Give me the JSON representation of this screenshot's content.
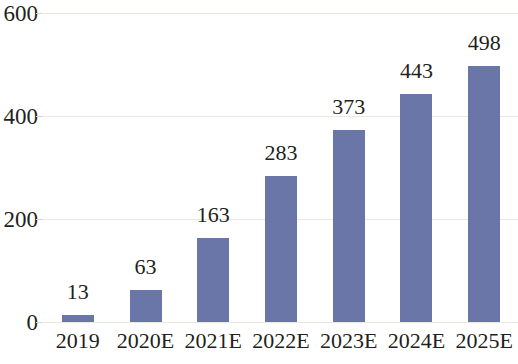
{
  "chart_data": {
    "type": "bar",
    "title": "",
    "subtitle": "",
    "xlabel": "",
    "ylabel": "",
    "categories": [
      "2019",
      "2020E",
      "2021E",
      "2022E",
      "2023E",
      "2024E",
      "2025E"
    ],
    "values": [
      13,
      63,
      163,
      283,
      373,
      443,
      498
    ],
    "data_labels": [
      "13",
      "63",
      "163",
      "283",
      "373",
      "443",
      "498"
    ],
    "y_ticks": [
      0,
      200,
      400,
      600
    ],
    "y_tick_labels": [
      "0",
      "200",
      "400",
      "600"
    ],
    "ylim": [
      0,
      600
    ],
    "grid": true,
    "grid_axis": "y",
    "legend": false,
    "legend_position": "none",
    "series": [
      {
        "name": "",
        "values": [
          13,
          63,
          163,
          283,
          373,
          443,
          498
        ],
        "color": "#6b76a8"
      }
    ]
  },
  "style": {
    "bar_color": "#6b76a8",
    "grid_color": "#e9e7e0",
    "text_color": "#231f20",
    "background": "#ffffff"
  }
}
